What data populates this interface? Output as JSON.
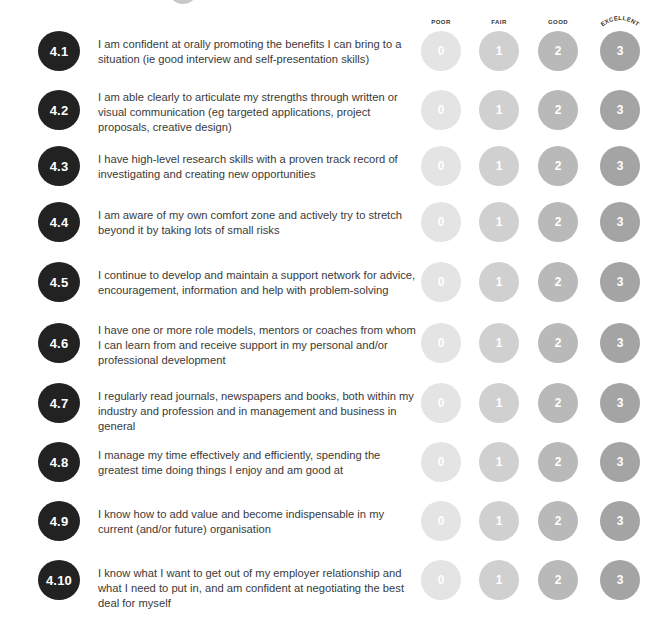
{
  "scale": {
    "labels": [
      "POOR",
      "FAIR",
      "GOOD",
      "EXCELLENT"
    ],
    "values": [
      "0",
      "1",
      "2",
      "3"
    ],
    "colors": [
      "#e4e4e4",
      "#d0d0d0",
      "#b9b9b9",
      "#a4a4a4"
    ]
  },
  "badge_color": "#222222",
  "items": [
    {
      "id": "4.1",
      "text": "I am confident at orally promoting the benefits I can bring to a situation (ie good interview and self-presentation skills)"
    },
    {
      "id": "4.2",
      "text": "I am able clearly to articulate my strengths through written or visual communication (eg targeted applications, project proposals, creative design)"
    },
    {
      "id": "4.3",
      "text": "I have high-level research skills with a proven track record of investigating and creating new opportunities"
    },
    {
      "id": "4.4",
      "text": "I am aware of my own comfort zone and actively try to stretch beyond it by taking lots of small risks"
    },
    {
      "id": "4.5",
      "text": "I continue to develop and maintain a support network for advice, encouragement, information and help with problem-solving"
    },
    {
      "id": "4.6",
      "text": "I have one or more role models, mentors or coaches from whom I can learn from and receive support in my personal and/or professional development"
    },
    {
      "id": "4.7",
      "text": "I regularly read journals, newspapers and books, both within my industry and profession and in management and business in general"
    },
    {
      "id": "4.8",
      "text": "I manage my time effectively and efficiently, spending the greatest time doing things I enjoy and am good at"
    },
    {
      "id": "4.9",
      "text": "I know how to add value and become indispensable in my current (and/or future) organisation"
    },
    {
      "id": "4.10",
      "text": "I know what I want to get out of my employer relationship and what I need to put in, and am confident at negotiating the best deal for myself"
    }
  ]
}
